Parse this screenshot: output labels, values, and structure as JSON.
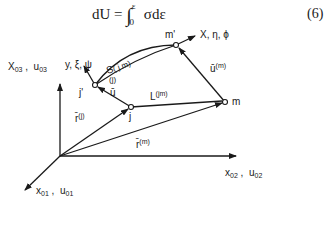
{
  "equation": {
    "lhs": "dU = ",
    "integral": "∫",
    "upper_limit": "ε",
    "lower_limit": "0",
    "integrand": " σdε",
    "number": "(6)"
  },
  "axes": {
    "vertical": {
      "name": "X",
      "sub": "03",
      "sep": " ,  ",
      "name2": "u",
      "sub2": "03"
    },
    "horizontal": {
      "name": "x",
      "sub": "02",
      "sep": " ,  ",
      "name2": "u",
      "sub2": "02"
    },
    "depth": {
      "name": "x",
      "sub": "01",
      "sep": " ,  ",
      "name2": "u",
      "sub2": "01"
    }
  },
  "points": {
    "j": "j",
    "j_prime": "j'",
    "m": "m",
    "m_prime": "m'"
  },
  "labels": {
    "local_y": "y, ξ, ψ",
    "local_x": "X, η, ϕ",
    "curve": "S",
    "curve_sup": "( j m)",
    "j_sup": "(j)",
    "u_bar": "ū",
    "L": "L",
    "L_sup": "(jm)",
    "r_j": "r̄",
    "r_j_sup": "(j)",
    "r_m": "r̄",
    "r_m_sup": "(m)",
    "u_m": "ū",
    "u_m_sup": "(m)"
  },
  "colors": {
    "line": "#1a1a1a",
    "background": "#ffffff"
  }
}
